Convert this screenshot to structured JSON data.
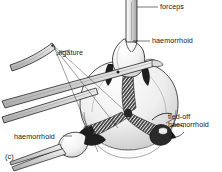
{
  "figure": {
    "caption": "(c)",
    "background_color": "#ffffff",
    "ink_color": "#1a1a1a",
    "shade_light": "#d8d8d8",
    "shade_mid": "#9a9a9a",
    "shade_dark": "#3a3a3a"
  },
  "labels": {
    "forceps": "forceps",
    "haemorrhoid_top": "haemorrhoid",
    "ligature": "ligature",
    "tied_off_line1": "tied-off",
    "tied_off_line2": "haemorrhoid",
    "haemorrhoid_left": "haemorrhoid"
  },
  "parts": [
    {
      "name": "forceps-shaft-top",
      "label": "forceps"
    },
    {
      "name": "haemorrhoid-top",
      "label": "haemorrhoid"
    },
    {
      "name": "ligature-threads",
      "label": "ligature"
    },
    {
      "name": "tied-off-haemorrhoid",
      "label": "tied-off haemorrhoid"
    },
    {
      "name": "haemorrhoid-lower-left",
      "label": "haemorrhoid"
    },
    {
      "name": "anal-canal-mass",
      "label": "anal canal mass"
    }
  ]
}
